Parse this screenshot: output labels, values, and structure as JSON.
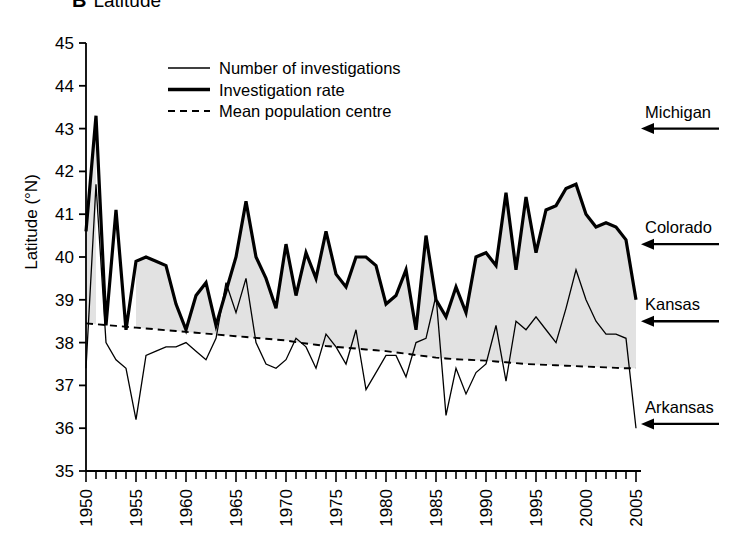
{
  "panel": {
    "letter": "B",
    "title": "Latitude"
  },
  "axes": {
    "y_title": "Latitude (°N)",
    "y_ticks": [
      "45",
      "44",
      "43",
      "42",
      "41",
      "40",
      "39",
      "38",
      "37",
      "36",
      "35"
    ],
    "x_ticks": [
      "1950",
      "1955",
      "1960",
      "1965",
      "1970",
      "1975",
      "1980",
      "1985",
      "1990",
      "1995",
      "2000",
      "2005"
    ]
  },
  "legend": {
    "items": [
      {
        "label": "Number of investigations",
        "style": "thin-solid",
        "color": "#000000"
      },
      {
        "label": "Investigation rate",
        "style": "thick-solid",
        "color": "#000000"
      },
      {
        "label": "Mean population centre",
        "style": "dashed",
        "color": "#000000"
      }
    ]
  },
  "annotations": [
    {
      "label": "Michigan",
      "latitude": 43.0
    },
    {
      "label": "Colorado",
      "latitude": 40.3
    },
    {
      "label": "Kansas",
      "latitude": 38.5
    },
    {
      "label": "Arkansas",
      "latitude": 36.1
    }
  ],
  "colors": {
    "line": "#000000",
    "fill_band": "#e2e2e2",
    "axis": "#000000",
    "background": "#ffffff"
  },
  "chart_data": {
    "type": "line",
    "xlabel": "",
    "ylabel": "Latitude (°N)",
    "xlim": [
      1950,
      2005
    ],
    "ylim": [
      35,
      45
    ],
    "grid": false,
    "legend_position": "top-center",
    "x": [
      1950,
      1951,
      1952,
      1953,
      1954,
      1955,
      1956,
      1957,
      1958,
      1959,
      1960,
      1961,
      1962,
      1963,
      1964,
      1965,
      1966,
      1967,
      1968,
      1969,
      1970,
      1971,
      1972,
      1973,
      1974,
      1975,
      1976,
      1977,
      1978,
      1979,
      1980,
      1981,
      1982,
      1983,
      1984,
      1985,
      1986,
      1987,
      1988,
      1989,
      1990,
      1991,
      1992,
      1993,
      1994,
      1995,
      1996,
      1997,
      1998,
      1999,
      2000,
      2001,
      2002,
      2003,
      2004,
      2005
    ],
    "series": [
      {
        "name": "Investigation rate",
        "style": "thick-solid",
        "values": [
          40.6,
          43.3,
          38.4,
          41.1,
          38.3,
          39.9,
          40.0,
          39.9,
          39.8,
          38.9,
          38.3,
          39.1,
          39.4,
          38.4,
          39.2,
          40.0,
          41.3,
          40.0,
          39.5,
          38.8,
          40.3,
          39.1,
          40.1,
          39.5,
          40.6,
          39.6,
          39.3,
          40.0,
          40.0,
          39.8,
          38.9,
          39.1,
          39.7,
          38.3,
          40.5,
          39.0,
          38.6,
          39.3,
          38.7,
          40.0,
          40.1,
          39.8,
          41.5,
          39.7,
          41.4,
          40.1,
          41.1,
          41.2,
          41.6,
          41.7,
          41.0,
          40.7,
          40.8,
          40.7,
          40.4,
          39.0
        ]
      },
      {
        "name": "Number of investigations",
        "style": "thin-solid",
        "values": [
          37.4,
          41.7,
          38.0,
          37.6,
          37.4,
          36.2,
          37.7,
          37.8,
          37.9,
          37.9,
          38.0,
          37.8,
          37.6,
          38.1,
          39.4,
          38.7,
          39.5,
          38.0,
          37.5,
          37.4,
          37.6,
          38.1,
          37.9,
          37.4,
          38.2,
          37.9,
          37.5,
          38.3,
          36.9,
          37.3,
          37.7,
          37.7,
          37.2,
          38.0,
          38.1,
          39.1,
          36.3,
          37.4,
          36.8,
          37.3,
          37.5,
          38.4,
          37.1,
          38.5,
          38.3,
          38.6,
          38.3,
          38.0,
          38.8,
          39.7,
          39.0,
          38.5,
          38.2,
          38.2,
          38.1,
          36.0
        ]
      },
      {
        "name": "Mean population centre",
        "style": "dashed",
        "values": [
          38.45,
          38.43,
          38.41,
          38.39,
          38.37,
          38.35,
          38.33,
          38.31,
          38.29,
          38.27,
          38.25,
          38.23,
          38.21,
          38.19,
          38.17,
          38.15,
          38.13,
          38.11,
          38.09,
          38.07,
          38.05,
          38.01,
          37.98,
          37.95,
          37.92,
          37.9,
          37.88,
          37.86,
          37.84,
          37.82,
          37.8,
          37.77,
          37.74,
          37.71,
          37.68,
          37.65,
          37.63,
          37.61,
          37.6,
          37.59,
          37.58,
          37.56,
          37.54,
          37.52,
          37.5,
          37.49,
          37.48,
          37.47,
          37.46,
          37.45,
          37.44,
          37.43,
          37.42,
          37.41,
          37.4,
          37.4
        ]
      }
    ]
  }
}
